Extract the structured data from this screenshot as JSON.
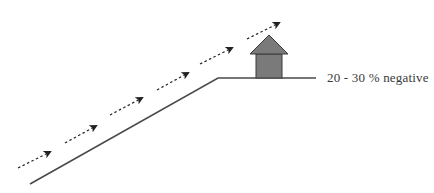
{
  "diagram": {
    "label": "20 - 30 % negative",
    "colors": {
      "line": "#4a4a4a",
      "arrow": "#222222",
      "house_fill": "#7a7a7a",
      "house_stroke": "#3a3a3a",
      "text": "#3a3a3a"
    },
    "ground": {
      "slope": {
        "x1": 30,
        "y1": 184,
        "x2": 218,
        "y2": 78
      },
      "flat": {
        "x1": 218,
        "y1": 78,
        "x2": 316,
        "y2": 78
      }
    },
    "arrows": [
      {
        "x1": 18,
        "y1": 168,
        "x2": 50,
        "y2": 152
      },
      {
        "x1": 65,
        "y1": 143,
        "x2": 96,
        "y2": 126
      },
      {
        "x1": 110,
        "y1": 115,
        "x2": 142,
        "y2": 98
      },
      {
        "x1": 157,
        "y1": 90,
        "x2": 188,
        "y2": 73
      },
      {
        "x1": 200,
        "y1": 64,
        "x2": 232,
        "y2": 48
      },
      {
        "x1": 247,
        "y1": 39,
        "x2": 279,
        "y2": 23
      }
    ],
    "house": {
      "body": {
        "x": 256,
        "y": 54,
        "w": 26,
        "h": 24
      },
      "roof": {
        "apex_x": 269,
        "apex_y": 35,
        "left_x": 250,
        "right_x": 288,
        "base_y": 54
      }
    }
  }
}
